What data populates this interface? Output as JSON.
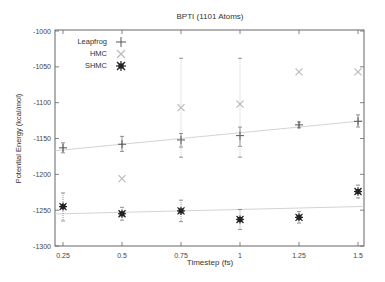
{
  "chart_data": {
    "type": "scatter",
    "title": "BPTI (1101 Atoms)",
    "xlabel": "Timestep (fs)",
    "ylabel": "Potential Energy (kcal/mol)",
    "xlim": [
      0.22,
      1.53
    ],
    "ylim": [
      -1300,
      -1000
    ],
    "x_ticks": [
      0.25,
      0.5,
      0.75,
      1,
      1.25,
      1.5
    ],
    "x_tick_labels": [
      "0.25",
      "0.5",
      "0.75",
      "1",
      "1.25",
      "1.5"
    ],
    "y_ticks": [
      -1000,
      -1050,
      -1100,
      -1150,
      -1200,
      -1250,
      -1300
    ],
    "y_tick_labels": [
      "-1000",
      "-1050",
      "-1100",
      "-1150",
      "-1200",
      "-1250",
      "-1300"
    ],
    "grid": false,
    "legend_position": "top-left",
    "x": [
      0.25,
      0.5,
      0.75,
      1,
      1.25,
      1.5
    ],
    "series": [
      {
        "name": "Leapfrog",
        "marker": "plus",
        "color": "#555555",
        "values": [
          -1163,
          -1158,
          -1152,
          -1146,
          -1131,
          -1126
        ],
        "err_low": [
          -1170,
          -1168,
          -1162,
          -1161,
          -1135,
          -1134
        ],
        "err_high": [
          -1156,
          -1147,
          -1143,
          -1134,
          -1127,
          -1117
        ],
        "trend": [
          -1166,
          -1126
        ]
      },
      {
        "name": "HMC",
        "marker": "x",
        "color": "#bbbbbb",
        "values": [
          null,
          -1206,
          -1107,
          -1102,
          -1057,
          -1057
        ],
        "err_low": [
          null,
          -1206,
          -1176,
          -1176,
          -1057,
          -1057
        ],
        "err_high": [
          null,
          -1206,
          -1038,
          -1038,
          -1057,
          -1057
        ]
      },
      {
        "name": "SHMC",
        "marker": "star",
        "color": "#222222",
        "values": [
          -1245,
          -1255,
          -1251,
          -1263,
          -1260,
          -1224
        ],
        "err_low": [
          -1265,
          -1264,
          -1266,
          -1277,
          -1268,
          -1233
        ],
        "err_high": [
          -1226,
          -1246,
          -1236,
          -1249,
          -1252,
          -1215
        ],
        "trend": [
          -1255,
          -1245
        ]
      }
    ]
  }
}
